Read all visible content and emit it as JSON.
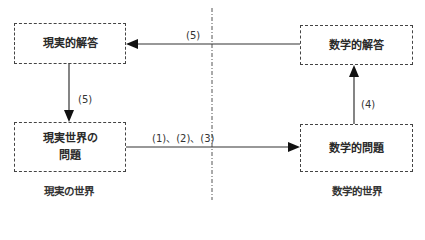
{
  "boxes": {
    "real_solution": "現実的解答",
    "math_solution": "数学的解答",
    "real_problem_line1": "現実世界の",
    "real_problem_line2": "問題",
    "math_problem": "数学的問題"
  },
  "arrows": {
    "top_label": "(5)",
    "left_label": "(5)",
    "right_label": "(4)",
    "bottom_label": "(1)、(2)、(3)"
  },
  "worlds": {
    "real": "現実の世界",
    "math": "数学的世界"
  }
}
